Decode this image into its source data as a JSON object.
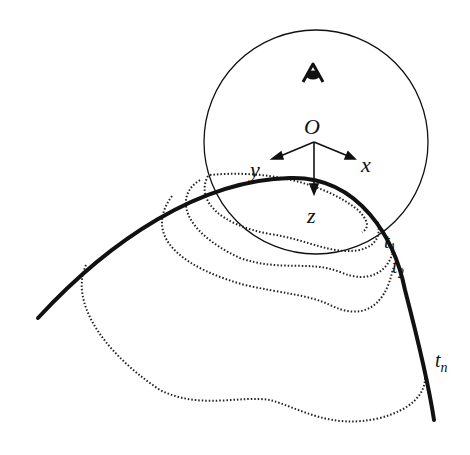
{
  "figure": {
    "origin_label": "O",
    "axes": {
      "x": "x",
      "y": "y",
      "z": "z"
    },
    "time_labels": [
      {
        "base": "t",
        "sub": "1"
      },
      {
        "base": "t",
        "sub": "2"
      },
      {
        "base": "t",
        "sub": "n"
      }
    ],
    "viewer_icon": "eye-icon",
    "colors": {
      "stroke": "#111111",
      "background": "#ffffff"
    }
  }
}
